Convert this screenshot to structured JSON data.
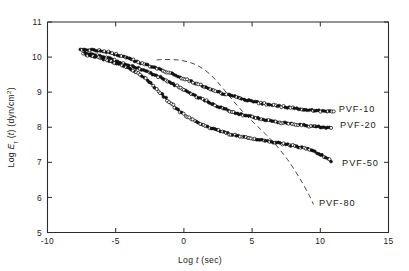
{
  "figure": {
    "background_color": "#ffffff",
    "ink_color": "#111111"
  },
  "chart_data": {
    "type": "line",
    "title": "",
    "subtitle": "",
    "xlabel": "Log t (sec)",
    "xlabel_parts": {
      "pre": "Log ",
      "italic": "t",
      "post": " (sec)"
    },
    "ylabel": "Log E_r(t) (dyn/cm2)",
    "ylabel_parts": {
      "pre": "Log ",
      "italic": "E",
      "sub": "r",
      "mid": " (",
      "italic2": "t",
      "post": ") (dyn/cm",
      "sup": "2",
      "tail": ")"
    },
    "xlim": [
      -10,
      15
    ],
    "ylim": [
      5,
      11
    ],
    "xticks": [
      -10,
      -5,
      0,
      5,
      10,
      15
    ],
    "xticklabels": [
      "-10",
      "-5",
      "0",
      "5",
      "10",
      "15"
    ],
    "yticks": [
      5,
      6,
      7,
      8,
      9,
      10,
      11
    ],
    "yticklabels": [
      "5",
      "6",
      "7",
      "8",
      "9",
      "10",
      "11"
    ],
    "grid": false,
    "legend_position": "inline-right-annotations",
    "marker_styles": [
      "open-circle",
      "filled-circle"
    ],
    "series": [
      {
        "name": "PVF-10",
        "label": "PVF-10",
        "style": "solid-with-markers",
        "label_x": 11.35,
        "label_y": 8.52,
        "x": [
          -7.6,
          -7.2,
          -6.8,
          -6.5,
          -6.2,
          -5.9,
          -5.6,
          -5.3,
          -5.0,
          -4.7,
          -4.4,
          -4.1,
          -3.8,
          -3.5,
          -3.2,
          -2.9,
          -2.6,
          -2.3,
          -2.0,
          -1.6,
          -1.2,
          -0.8,
          -0.4,
          0.0,
          0.5,
          1.0,
          1.6,
          2.2,
          2.8,
          3.5,
          4.2,
          5.0,
          5.8,
          6.6,
          7.4,
          8.2,
          9.0,
          9.8,
          10.5,
          11.0
        ],
        "y": [
          10.22,
          10.21,
          10.2,
          10.19,
          10.18,
          10.16,
          10.14,
          10.11,
          10.08,
          10.04,
          10.0,
          9.96,
          9.92,
          9.88,
          9.84,
          9.8,
          9.76,
          9.72,
          9.68,
          9.63,
          9.57,
          9.51,
          9.45,
          9.39,
          9.31,
          9.23,
          9.14,
          9.05,
          8.97,
          8.89,
          8.81,
          8.74,
          8.68,
          8.63,
          8.58,
          8.54,
          8.5,
          8.47,
          8.45,
          8.44
        ]
      },
      {
        "name": "PVF-20",
        "label": "PVF-20",
        "style": "solid-with-markers",
        "label_x": 11.45,
        "label_y": 8.08,
        "x": [
          -7.4,
          -7.0,
          -6.6,
          -6.3,
          -6.0,
          -5.7,
          -5.4,
          -5.1,
          -4.8,
          -4.5,
          -4.2,
          -3.9,
          -3.6,
          -3.3,
          -3.0,
          -2.7,
          -2.4,
          -2.1,
          -1.8,
          -1.4,
          -1.0,
          -0.6,
          -0.2,
          0.3,
          0.8,
          1.4,
          2.0,
          2.6,
          3.3,
          4.0,
          4.8,
          5.6,
          6.4,
          7.2,
          8.0,
          8.8,
          9.5,
          10.2,
          10.8
        ],
        "y": [
          10.12,
          10.1,
          10.08,
          10.05,
          10.02,
          9.99,
          9.95,
          9.91,
          9.87,
          9.83,
          9.79,
          9.75,
          9.71,
          9.67,
          9.63,
          9.59,
          9.54,
          9.49,
          9.43,
          9.36,
          9.28,
          9.19,
          9.1,
          9.0,
          8.9,
          8.79,
          8.68,
          8.58,
          8.48,
          8.39,
          8.31,
          8.24,
          8.18,
          8.13,
          8.09,
          8.05,
          8.02,
          8.0,
          7.98
        ]
      },
      {
        "name": "PVF-50",
        "label": "PVF-50",
        "style": "solid-with-markers",
        "label_x": 11.6,
        "label_y": 6.98,
        "x": [
          -7.2,
          -6.8,
          -6.4,
          -6.1,
          -5.8,
          -5.5,
          -5.2,
          -4.9,
          -4.6,
          -4.3,
          -4.0,
          -3.7,
          -3.4,
          -3.1,
          -2.8,
          -2.5,
          -2.2,
          -1.9,
          -1.6,
          -1.3,
          -1.0,
          -0.6,
          -0.2,
          0.3,
          0.8,
          1.4,
          2.0,
          2.7,
          3.4,
          4.2,
          5.0,
          5.8,
          6.6,
          7.4,
          8.2,
          9.0,
          9.7,
          10.3,
          10.8
        ],
        "y": [
          10.06,
          10.03,
          10.0,
          9.97,
          9.94,
          9.9,
          9.86,
          9.82,
          9.78,
          9.73,
          9.68,
          9.62,
          9.55,
          9.47,
          9.38,
          9.28,
          9.17,
          9.05,
          8.93,
          8.81,
          8.69,
          8.55,
          8.42,
          8.29,
          8.18,
          8.07,
          7.97,
          7.88,
          7.8,
          7.73,
          7.67,
          7.62,
          7.57,
          7.52,
          7.46,
          7.38,
          7.28,
          7.16,
          7.04
        ]
      },
      {
        "name": "PVF-80",
        "label": "PVF-80",
        "style": "dashed-no-markers",
        "label_x": 9.9,
        "label_y": 5.86,
        "x": [
          -2.0,
          -1.5,
          -1.0,
          -0.5,
          0.0,
          0.5,
          1.0,
          1.5,
          2.0,
          2.4,
          2.8,
          3.2,
          3.6,
          4.0,
          4.4,
          4.8,
          5.2,
          5.6,
          6.0,
          6.4,
          6.8,
          7.2,
          7.6,
          8.0,
          8.4,
          8.8,
          9.2,
          9.5
        ],
        "y": [
          9.92,
          9.93,
          9.93,
          9.92,
          9.89,
          9.84,
          9.76,
          9.64,
          9.48,
          9.32,
          9.14,
          8.95,
          8.76,
          8.58,
          8.41,
          8.25,
          8.1,
          7.95,
          7.8,
          7.64,
          7.47,
          7.28,
          7.08,
          6.85,
          6.6,
          6.34,
          6.05,
          5.8
        ]
      }
    ]
  }
}
